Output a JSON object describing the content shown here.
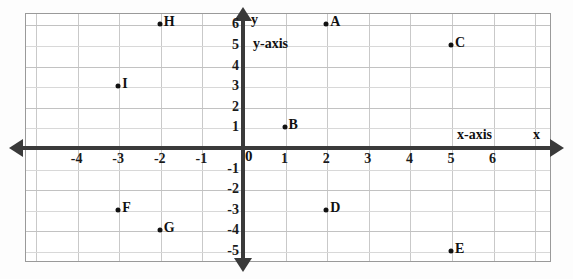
{
  "chart_data": {
    "type": "scatter",
    "title": "",
    "xlabel": "x-axis",
    "ylabel": "y-axis",
    "xlim": [
      -4.7,
      6.6
    ],
    "ylim": [
      -5.6,
      6.5
    ],
    "grid": true,
    "legend": "none",
    "axis_arrow_labels": {
      "x": "x",
      "y": "y"
    },
    "origin_label": "0",
    "x_ticks": [
      {
        "label": "-4",
        "value": -4
      },
      {
        "label": "-3",
        "value": -3
      },
      {
        "label": "-2",
        "value": -2
      },
      {
        "label": "-1",
        "value": -1
      },
      {
        "label": "1",
        "value": 1
      },
      {
        "label": "2",
        "value": 2
      },
      {
        "label": "3",
        "value": 3
      },
      {
        "label": "4",
        "value": 4
      },
      {
        "label": "5",
        "value": 5
      },
      {
        "label": "6",
        "value": 6
      }
    ],
    "y_ticks": [
      {
        "label": "6",
        "value": 6
      },
      {
        "label": "5",
        "value": 5
      },
      {
        "label": "4",
        "value": 4
      },
      {
        "label": "3",
        "value": 3
      },
      {
        "label": "2",
        "value": 2
      },
      {
        "label": "1",
        "value": 1
      },
      {
        "label": "-1",
        "value": -1
      },
      {
        "label": "-2",
        "value": -2
      },
      {
        "label": "-3",
        "value": -3
      },
      {
        "label": "-4",
        "value": -4
      },
      {
        "label": "-5",
        "value": -5
      }
    ],
    "points": [
      {
        "label": "A",
        "x": 2,
        "y": 6
      },
      {
        "label": "B",
        "x": 1,
        "y": 1
      },
      {
        "label": "C",
        "x": 5,
        "y": 5
      },
      {
        "label": "D",
        "x": 2,
        "y": -3
      },
      {
        "label": "E",
        "x": 5,
        "y": -5
      },
      {
        "label": "F",
        "x": -3,
        "y": -3
      },
      {
        "label": "G",
        "x": -2,
        "y": -4
      },
      {
        "label": "H",
        "x": -2,
        "y": 6
      },
      {
        "label": "I",
        "x": -3,
        "y": 3
      }
    ]
  },
  "colors": {
    "axis": "#3a3a3a",
    "grid_minor": "#d8d8d8",
    "grid_major": "#c2c2c2",
    "border": "#9a9a9a",
    "text": "#111111",
    "point": "#111111",
    "background": "#ffffff"
  }
}
